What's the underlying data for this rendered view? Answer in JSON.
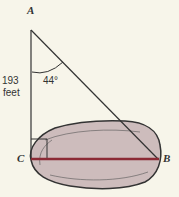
{
  "diagram": {
    "labels": {
      "A": "A",
      "B": "B",
      "C": "C"
    },
    "side_length": "193",
    "side_unit": "feet",
    "angle": "44°"
  },
  "colors": {
    "background": "#f7f5ea",
    "pond": "#cdbcbc",
    "segment": "#8b2a35",
    "lines": "#333333"
  }
}
